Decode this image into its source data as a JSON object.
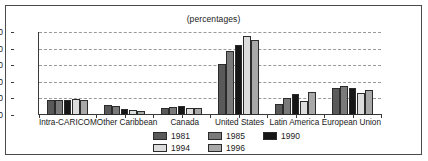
{
  "chart_data": {
    "type": "bar",
    "title": "(percentages)",
    "xlabel": "",
    "ylabel": "",
    "ylim": [
      0,
      50
    ],
    "yticks": [
      0,
      10,
      20,
      30,
      40,
      50
    ],
    "grid": true,
    "legend_position": "bottom",
    "categories": [
      "Intra-CARICOM",
      "Other Caribbean",
      "Canada",
      "United States",
      "Latin America",
      "European Union"
    ],
    "series": [
      {
        "name": "1981",
        "color": "#595959",
        "values": [
          9.3,
          6.0,
          4.5,
          30.5,
          6.5,
          16.5
        ]
      },
      {
        "name": "1985",
        "color": "#7a7a7a",
        "values": [
          9.0,
          5.5,
          5.0,
          38.5,
          10.5,
          17.5
        ]
      },
      {
        "name": "1990",
        "color": "#161616",
        "values": [
          9.0,
          3.5,
          5.5,
          42.0,
          12.5,
          16.5
        ]
      },
      {
        "name": "1994",
        "color": "#dcdcdc",
        "values": [
          9.8,
          3.0,
          4.5,
          47.5,
          8.5,
          13.5
        ]
      },
      {
        "name": "1996",
        "color": "#a8a8a8",
        "values": [
          9.0,
          2.5,
          4.0,
          45.0,
          14.0,
          15.0
        ]
      }
    ]
  },
  "legend": {
    "rows": [
      [
        {
          "label": "1981",
          "color": "#595959"
        },
        {
          "label": "1985",
          "color": "#7a7a7a"
        },
        {
          "label": "1990",
          "color": "#161616"
        }
      ],
      [
        {
          "label": "1994",
          "color": "#dcdcdc"
        },
        {
          "label": "1996",
          "color": "#a8a8a8"
        }
      ]
    ]
  },
  "colors": {
    "frame": "#4a4a4a",
    "gridline": "#9a9a9a",
    "axis": "#3a3a3a",
    "text": "#1a1a1a",
    "background": "#ffffff"
  }
}
